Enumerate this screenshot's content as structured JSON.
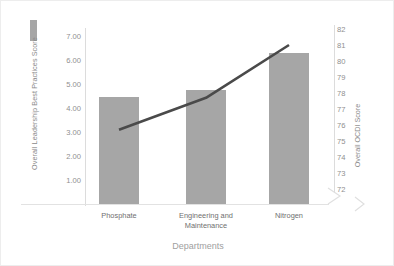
{
  "chart_data": {
    "type": "bar",
    "title": "",
    "xlabel": "Departments",
    "categories": [
      "Phosphate",
      "Engineering and Maintenance",
      "Nitrogen"
    ],
    "grid": false,
    "legend_position": "top-left",
    "series": [
      {
        "name": "Overall Leadership Best Practices Score",
        "type": "bar",
        "axis": "left",
        "color": "#a6a6a6",
        "values": [
          4.45,
          4.75,
          6.3
        ]
      },
      {
        "name": "Overall OCDI Score",
        "type": "line",
        "axis": "right",
        "color": "#4a4a4a",
        "values": [
          75.7,
          77.7,
          81.0
        ]
      }
    ],
    "left_axis": {
      "label": "Overall Leadership Best Practices Score",
      "ticks": [
        "7.00",
        "6.00",
        "5.00",
        "4.00",
        "3.00",
        "2.00",
        "1.00"
      ],
      "tick_values": [
        7,
        6,
        5,
        4,
        3,
        2,
        1
      ],
      "ylim": [
        0,
        7
      ]
    },
    "right_axis": {
      "label": "Overall OCDI Score",
      "ticks": [
        "82",
        "81",
        "80",
        "79",
        "78",
        "77",
        "76",
        "75",
        "74",
        "73",
        "72"
      ],
      "tick_values": [
        82,
        81,
        80,
        79,
        78,
        77,
        76,
        75,
        74,
        73,
        72
      ],
      "ylim": [
        72,
        82
      ],
      "axis_break": true
    }
  },
  "legend": {
    "bar_swatch_color": "#a6a6a6"
  },
  "categories_display": [
    {
      "line1": "Phosphate",
      "line2": ""
    },
    {
      "line1": "Engineering and",
      "line2": "Maintenance"
    },
    {
      "line1": "Nitrogen",
      "line2": ""
    }
  ]
}
